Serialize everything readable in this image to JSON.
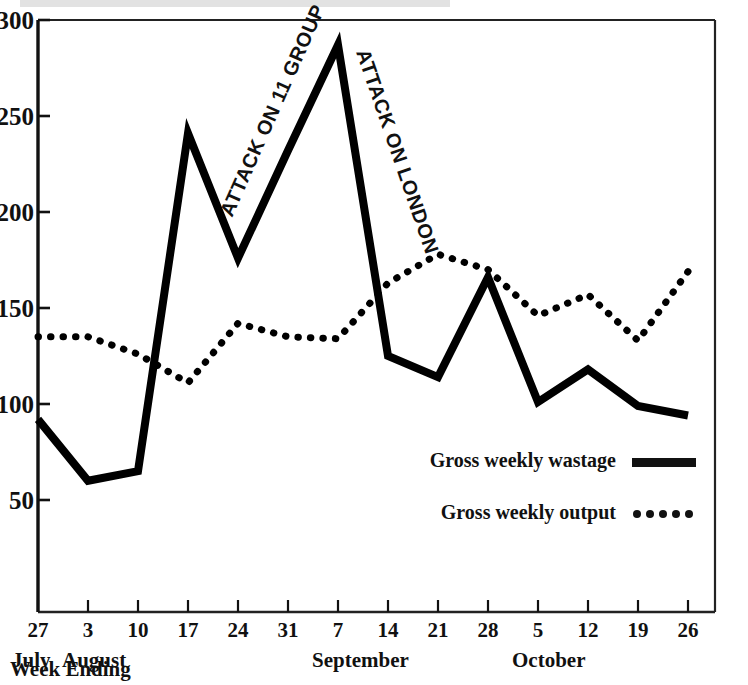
{
  "chart_data": {
    "type": "line",
    "title": "",
    "xlabel": "Week Ending",
    "ylabel": "",
    "ylim": [
      0,
      300
    ],
    "yticks": [
      50,
      100,
      150,
      200,
      250,
      300
    ],
    "grid": false,
    "legend_position": "inside-lower-right",
    "categories": [
      "27",
      "3",
      "10",
      "17",
      "24",
      "31",
      "7",
      "14",
      "21",
      "28",
      "5",
      "12",
      "19",
      "26"
    ],
    "month_groups": [
      {
        "label": "July",
        "start_index": 0
      },
      {
        "label": "August",
        "start_index": 1
      },
      {
        "label": "September",
        "start_index": 6
      },
      {
        "label": "October",
        "start_index": 10
      }
    ],
    "series": [
      {
        "name": "Gross weekly wastage",
        "style": "solid",
        "values": [
          92,
          60,
          65,
          241,
          176,
          232,
          287,
          125,
          114,
          166,
          101,
          118,
          99,
          94
        ]
      },
      {
        "name": "Gross weekly output",
        "style": "dotted",
        "values": [
          135,
          135,
          126,
          111,
          142,
          135,
          134,
          163,
          178,
          170,
          146,
          157,
          133,
          169
        ]
      }
    ],
    "annotations": [
      {
        "text": "ATTACK ON 11 GROUP",
        "near_index": 5
      },
      {
        "text": "ATTACK ON LONDON",
        "near_index": 7
      }
    ]
  },
  "axis": {
    "y_labels": [
      "300",
      "250",
      "200",
      "150",
      "100",
      "50"
    ],
    "x_labels": [
      "27",
      "3",
      "10",
      "17",
      "24",
      "31",
      "7",
      "14",
      "21",
      "28",
      "5",
      "12",
      "19",
      "26"
    ],
    "month_labels": [
      "July",
      "August",
      "September",
      "October"
    ],
    "caption": "Week Ending"
  },
  "legend": {
    "items": [
      {
        "label": "Gross weekly wastage",
        "swatch": "solid-line-swatch"
      },
      {
        "label": "Gross weekly output",
        "swatch": "dotted-line-swatch"
      }
    ]
  },
  "annotations": {
    "attack_11_group": "ATTACK ON 11 GROUP",
    "attack_london": "ATTACK ON LONDON"
  },
  "colors": {
    "ink": "#000000",
    "paper": "#ffffff",
    "axis": "#1a1a1a"
  }
}
